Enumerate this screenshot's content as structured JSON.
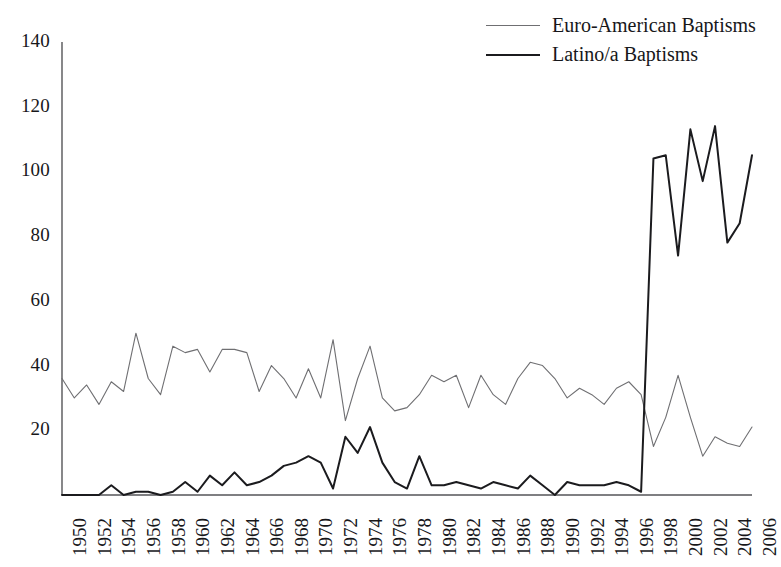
{
  "chart_data": {
    "type": "line",
    "title": "",
    "xlabel": "",
    "ylabel": "",
    "xlim": [
      1950,
      2006
    ],
    "ylim": [
      0,
      140
    ],
    "grid": false,
    "legend_position": "top-right",
    "yticks": [
      0,
      20,
      40,
      60,
      80,
      100,
      120,
      140
    ],
    "ytick_labels": [
      "",
      "20",
      "40",
      "60",
      "80",
      "100",
      "120",
      "140"
    ],
    "x": [
      1950,
      1951,
      1952,
      1953,
      1954,
      1955,
      1956,
      1957,
      1958,
      1959,
      1960,
      1961,
      1962,
      1963,
      1964,
      1965,
      1966,
      1967,
      1968,
      1969,
      1970,
      1971,
      1972,
      1973,
      1974,
      1975,
      1976,
      1977,
      1978,
      1979,
      1980,
      1981,
      1982,
      1983,
      1984,
      1985,
      1986,
      1987,
      1988,
      1989,
      1990,
      1991,
      1992,
      1993,
      1994,
      1995,
      1996,
      1997,
      1998,
      1999,
      2000,
      2001,
      2002,
      2003,
      2004,
      2005,
      2006
    ],
    "xtick_labels": [
      "1950",
      "1952",
      "1954",
      "1956",
      "1958",
      "1960",
      "1962",
      "1964",
      "1966",
      "1968",
      "1970",
      "1972",
      "1974",
      "1976",
      "1978",
      "1980",
      "1982",
      "1984",
      "1986",
      "1988",
      "1990",
      "1992",
      "1994",
      "1996",
      "1998",
      "2000",
      "2002",
      "2004",
      "2006"
    ],
    "series": [
      {
        "name": "Euro-American Baptisms",
        "color": "#6f6f72",
        "width": 1.1,
        "values": [
          36,
          30,
          34,
          28,
          35,
          32,
          50,
          36,
          31,
          46,
          44,
          45,
          38,
          45,
          45,
          44,
          32,
          40,
          36,
          30,
          39,
          30,
          48,
          23,
          36,
          46,
          30,
          26,
          27,
          31,
          37,
          35,
          37,
          27,
          37,
          31,
          28,
          36,
          41,
          40,
          36,
          30,
          33,
          31,
          28,
          33,
          35,
          31,
          15,
          24,
          37,
          24,
          12,
          18,
          16,
          15,
          21
        ]
      },
      {
        "name": "Latino/a Baptisms",
        "color": "#1b1b1e",
        "width": 2.0,
        "values": [
          0,
          0,
          0,
          0,
          3,
          0,
          1,
          1,
          0,
          1,
          4,
          1,
          6,
          3,
          7,
          3,
          4,
          6,
          9,
          10,
          12,
          10,
          2,
          18,
          13,
          21,
          10,
          4,
          2,
          12,
          3,
          3,
          4,
          3,
          2,
          4,
          3,
          2,
          6,
          3,
          0,
          4,
          3,
          3,
          3,
          4,
          3,
          1,
          104,
          105,
          74,
          113,
          97,
          114,
          78,
          84,
          105
        ]
      }
    ]
  },
  "legend": {
    "entries": [
      {
        "label": "Euro-American Baptisms",
        "style": "thin"
      },
      {
        "label": "Latino/a Baptisms",
        "style": "thick"
      }
    ]
  },
  "axes": {
    "axis_color": "#555558",
    "background": "#ffffff"
  }
}
